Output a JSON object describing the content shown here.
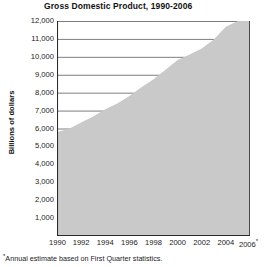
{
  "chart_data": {
    "type": "area",
    "title": "Gross Domestic Product, 1990-2006",
    "xlabel": "",
    "ylabel": "Billions of dollars",
    "ylim": [
      0,
      12000
    ],
    "xlim": [
      1990,
      2006
    ],
    "grid": true,
    "legend": null,
    "footnote": "Annual estimate based on First Quarter statistics.",
    "footnote_marker": "*",
    "x_tick_labels": [
      "1990",
      "1992",
      "1994",
      "1996",
      "1998",
      "2000",
      "2002",
      "2004",
      "2006"
    ],
    "x_last_tick_marker": "*",
    "y_tick_labels": [
      "12,000",
      "11,000",
      "10,000",
      "9,000",
      "8,000",
      "7,000",
      "6,000",
      "5,000",
      "4,000",
      "3,000",
      "2,000",
      "1,000"
    ],
    "y_ticks": [
      12000,
      11000,
      10000,
      9000,
      8000,
      7000,
      6000,
      5000,
      4000,
      3000,
      2000,
      1000
    ],
    "categories": [
      1990,
      1991,
      1992,
      1993,
      1994,
      1995,
      1996,
      1997,
      1998,
      1999,
      2000,
      2001,
      2002,
      2003,
      2004,
      2005,
      2006
    ],
    "values": [
      5800,
      5990,
      6340,
      6670,
      7070,
      7400,
      7820,
      8300,
      8750,
      9280,
      9820,
      10130,
      10470,
      10970,
      11680,
      12420,
      13050
    ],
    "series": [
      {
        "name": "Gross Domestic Product",
        "values": [
          5800,
          5990,
          6340,
          6670,
          7070,
          7400,
          7820,
          8300,
          8750,
          9280,
          9820,
          10130,
          10470,
          10970,
          11680,
          12420,
          13050
        ]
      }
    ],
    "area_fill_color": "#c9c9c9",
    "gridline_color": "#6e6e6e",
    "axis_color": "#2b2b2b"
  }
}
